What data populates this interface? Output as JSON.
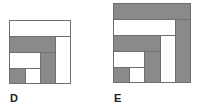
{
  "figures": [
    {
      "label": "D"
    },
    {
      "label": "E"
    }
  ],
  "colors": {
    "fill": "#8a8a8a",
    "border": "#6f6f6f",
    "background": "#ffffff"
  }
}
